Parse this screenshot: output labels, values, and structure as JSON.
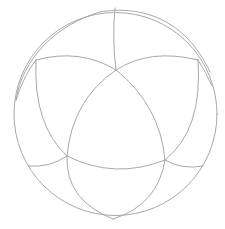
{
  "diagram": {
    "type": "spherical-polyhedron-projection",
    "stroke_color": "#a8a8a8",
    "background": "#ffffff",
    "outer_circle": {
      "cx": 115.5,
      "cy": 114,
      "r": 101.5
    },
    "outer_offset_arc": "M 16 100 C 22 60, 55 25, 100 12 C 140 5, 185 18, 210 72",
    "vertices": {
      "top_inner": [
        116,
        70
      ],
      "left_inner": [
        67,
        156
      ],
      "right_inner": [
        165,
        160
      ],
      "upper_left_outer": [
        36,
        60
      ],
      "upper_right_outer": [
        198,
        60
      ],
      "top_rim": [
        115,
        8
      ],
      "bottom_rim": [
        113,
        219
      ],
      "left_rim": [
        28,
        166
      ],
      "right_rim": [
        203,
        166
      ]
    },
    "edges": [
      {
        "name": "top-rim-to-top-inner",
        "d": "M 115 8 Q 112 40 116 70"
      },
      {
        "name": "top-inner-to-left-inner",
        "d": "M 116 70 Q 72 100 67 156"
      },
      {
        "name": "top-inner-to-right-inner",
        "d": "M 116 70 Q 160 105 165 160"
      },
      {
        "name": "left-inner-to-right-inner",
        "d": "M 67 156 Q 115 180 165 160"
      },
      {
        "name": "upper-left-outer-to-top-inner",
        "d": "M 36 60 Q 80 48 116 70"
      },
      {
        "name": "upper-right-outer-to-top-inner",
        "d": "M 198 60 Q 150 48 116 70"
      },
      {
        "name": "upper-left-outer-to-left-inner",
        "d": "M 36 60 Q 33 125 67 156"
      },
      {
        "name": "upper-right-outer-to-right-inner",
        "d": "M 198 60 Q 203 130 165 160"
      },
      {
        "name": "upper-left-outer-to-rim",
        "d": "M 36 60 Q 24 75 16 100"
      },
      {
        "name": "upper-right-outer-to-rim",
        "d": "M 198 60 Q 206 72 212 86"
      },
      {
        "name": "left-inner-to-left-rim",
        "d": "M 67 156 Q 50 168 28 166"
      },
      {
        "name": "right-inner-to-right-rim",
        "d": "M 165 160 Q 182 170 203 166"
      },
      {
        "name": "left-inner-to-bottom-rim",
        "d": "M 67 156 Q 65 200 113 219"
      },
      {
        "name": "right-inner-to-bottom-rim",
        "d": "M 165 160 Q 158 205 113 219"
      }
    ]
  }
}
